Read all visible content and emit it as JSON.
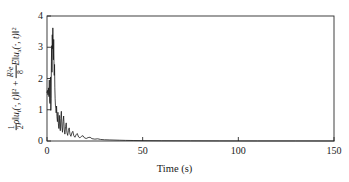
{
  "chart_data": {
    "type": "line",
    "title": "",
    "xlabel": "Time (s)",
    "ylabel_plain": "1/2 rho || u_t(.,t) ||^2 + (R^2 e / 8) E|| u_x(.,t) ||^2",
    "ylabel_parts": {
      "half_num": "1",
      "half_den": "2",
      "rho": "ρ",
      "norm_open_1": "‖",
      "u1": "u",
      "u1_sub": "t",
      "arg1": "(·, t)",
      "norm_close_1": "‖",
      "exp1": "2",
      "plus": "+",
      "frac_num": "R",
      "frac_num_sup": "2",
      "frac_num_e": "e",
      "frac_den": "8",
      "E": "E",
      "norm_open_2": "‖",
      "u2": "u",
      "u2_sub": "x",
      "arg2": "(·, t)",
      "norm_close_2": "‖",
      "exp2": "2"
    },
    "xlim": [
      0,
      150
    ],
    "ylim": [
      0,
      4
    ],
    "xticks": [
      "0",
      "50",
      "100",
      "150"
    ],
    "xtick_values": [
      0,
      50,
      100,
      150
    ],
    "yticks": [
      "0",
      "1",
      "2",
      "3",
      "4"
    ],
    "ytick_values": [
      0,
      1,
      2,
      3,
      4
    ],
    "grid": false,
    "legend": "none",
    "line_color": "#1a1a1a",
    "axis_color": "#2b2b2b",
    "background": "#ffffff",
    "series": [
      {
        "name": "energy",
        "x": [
          0.0,
          0.25,
          0.5,
          0.75,
          1.0,
          1.2,
          1.4,
          1.55,
          1.7,
          1.85,
          2.0,
          2.15,
          2.3,
          2.45,
          2.6,
          2.75,
          2.9,
          3.05,
          3.2,
          3.35,
          3.5,
          3.65,
          3.8,
          3.95,
          4.1,
          4.25,
          4.4,
          4.6,
          4.8,
          5.0,
          5.2,
          5.45,
          5.7,
          5.95,
          6.2,
          6.45,
          6.7,
          6.95,
          7.2,
          7.5,
          7.8,
          8.1,
          8.4,
          8.7,
          9.0,
          9.35,
          9.7,
          10.05,
          10.4,
          10.8,
          11.2,
          11.6,
          12.0,
          12.5,
          13.0,
          13.5,
          14.0,
          14.6,
          15.2,
          15.8,
          16.5,
          17.2,
          18.0,
          18.8,
          19.6,
          20.5,
          21.5,
          22.5,
          23.5,
          25.0,
          26.5,
          28.0,
          30.0,
          32.5,
          35.0,
          38.0,
          41.0,
          45.0,
          50.0,
          60.0,
          75.0,
          90.0,
          110.0,
          130.0,
          150.0
        ],
        "y": [
          1.55,
          1.62,
          1.48,
          1.7,
          1.42,
          1.95,
          1.28,
          1.2,
          1.85,
          2.05,
          0.98,
          1.35,
          2.55,
          3.05,
          2.2,
          3.4,
          2.95,
          3.62,
          3.1,
          2.6,
          3.25,
          2.55,
          2.1,
          2.45,
          1.7,
          1.35,
          1.15,
          1.05,
          0.9,
          1.12,
          0.78,
          0.62,
          0.92,
          0.55,
          0.4,
          0.82,
          0.48,
          0.33,
          0.72,
          0.95,
          0.45,
          0.28,
          0.62,
          0.8,
          0.38,
          0.22,
          0.46,
          0.58,
          0.28,
          0.18,
          0.34,
          0.42,
          0.22,
          0.15,
          0.26,
          0.31,
          0.17,
          0.12,
          0.2,
          0.24,
          0.13,
          0.1,
          0.15,
          0.17,
          0.1,
          0.08,
          0.11,
          0.12,
          0.075,
          0.06,
          0.07,
          0.05,
          0.04,
          0.035,
          0.03,
          0.025,
          0.02,
          0.016,
          0.012,
          0.008,
          0.005,
          0.003,
          0.002,
          0.0015,
          0.001
        ]
      }
    ]
  },
  "axes": {
    "plot_box": {
      "left": 47,
      "top": 16,
      "right": 334,
      "bottom": 141
    },
    "tick_len": 4
  }
}
